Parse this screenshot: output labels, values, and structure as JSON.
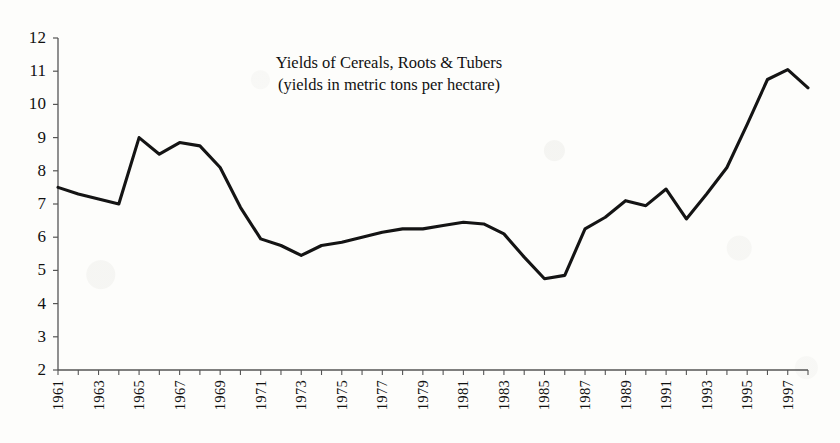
{
  "chart_data": {
    "type": "line",
    "title": "Yields of Cereals, Roots & Tubers",
    "subtitle": "(yields in metric tons per hectare)",
    "xlabel": "",
    "ylabel": "",
    "ylim": [
      2,
      12
    ],
    "xlim": [
      1961,
      1998
    ],
    "grid": false,
    "legend": "none",
    "y_ticks": [
      "12",
      "11",
      "10",
      "9",
      "8",
      "7",
      "6",
      "5",
      "4",
      "3",
      "2"
    ],
    "x_ticks": [
      "1961",
      "1963",
      "1965",
      "1967",
      "1969",
      "1971",
      "1973",
      "1975",
      "1977",
      "1979",
      "1981",
      "1983",
      "1985",
      "1987",
      "1989",
      "1991",
      "1993",
      "1995",
      "1997"
    ],
    "x": [
      1961,
      1962,
      1963,
      1964,
      1965,
      1966,
      1967,
      1968,
      1969,
      1970,
      1971,
      1972,
      1973,
      1974,
      1975,
      1976,
      1977,
      1978,
      1979,
      1980,
      1981,
      1982,
      1983,
      1984,
      1985,
      1986,
      1987,
      1988,
      1989,
      1990,
      1991,
      1992,
      1993,
      1994,
      1995,
      1996,
      1997,
      1998
    ],
    "values": [
      7.5,
      7.3,
      7.15,
      7.0,
      9.0,
      8.5,
      8.85,
      8.75,
      8.1,
      6.9,
      5.95,
      5.75,
      5.45,
      5.75,
      5.85,
      6.0,
      6.15,
      6.25,
      6.25,
      6.35,
      6.45,
      6.4,
      6.1,
      5.4,
      4.75,
      4.85,
      6.25,
      6.6,
      7.1,
      6.95,
      7.45,
      6.55,
      7.3,
      8.1,
      9.4,
      10.75,
      11.05,
      10.5
    ],
    "series_name": "Yields of Cereals, Roots & Tubers",
    "line_color": "#141414",
    "axis_color": "#4a4a4a",
    "background": "#fdfdfb"
  },
  "axes": {
    "y_title": "",
    "x_title": ""
  }
}
